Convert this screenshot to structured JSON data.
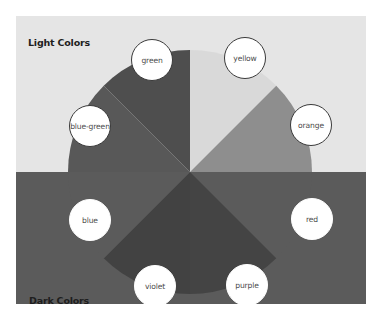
{
  "diagram": {
    "title_light": "Light Colors",
    "title_dark": "Dark Colors",
    "background": {
      "light_half": "#e5e5e5",
      "dark_half": "#5b5b5b"
    },
    "wheel": {
      "segments": [
        {
          "name": "yellow",
          "label": "yellow",
          "fill": "#d9d9d9",
          "start_deg": 0,
          "end_deg": 45
        },
        {
          "name": "orange",
          "label": "orange",
          "fill": "#8e8e8e",
          "start_deg": 45,
          "end_deg": 90
        },
        {
          "name": "red",
          "label": "red",
          "fill": "#5b5b5b",
          "start_deg": 90,
          "end_deg": 135
        },
        {
          "name": "purple",
          "label": "purple",
          "fill": "#444444",
          "start_deg": 135,
          "end_deg": 180
        },
        {
          "name": "violet",
          "label": "violet",
          "fill": "#424242",
          "start_deg": 180,
          "end_deg": 225
        },
        {
          "name": "blue",
          "label": "blue",
          "fill": "#5b5b5b",
          "start_deg": 225,
          "end_deg": 270
        },
        {
          "name": "blue-green",
          "label": "blue-green",
          "fill": "#585858",
          "start_deg": 270,
          "end_deg": 315
        },
        {
          "name": "green",
          "label": "green",
          "fill": "#4e4e4e",
          "start_deg": 315,
          "end_deg": 360
        }
      ]
    },
    "labels": [
      {
        "name": "green",
        "text": "green",
        "on_dark": false
      },
      {
        "name": "yellow",
        "text": "yellow",
        "on_dark": false
      },
      {
        "name": "blue-green",
        "text": "blue-green",
        "on_dark": false
      },
      {
        "name": "orange",
        "text": "orange",
        "on_dark": false
      },
      {
        "name": "blue",
        "text": "blue",
        "on_dark": true
      },
      {
        "name": "red",
        "text": "red",
        "on_dark": true
      },
      {
        "name": "violet",
        "text": "violet",
        "on_dark": true
      },
      {
        "name": "purple",
        "text": "purple",
        "on_dark": true
      }
    ]
  }
}
